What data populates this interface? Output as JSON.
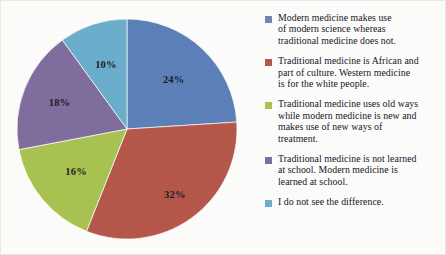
{
  "chart_data": {
    "type": "pie",
    "title": "",
    "labels": [
      "Modern medicine makes use of modern science whereas traditional medicine does not.",
      "Traditional medicine is African and part of culture. Western medicine is for the white people.",
      "Traditional medicine uses old ways while modern medicine is new and makes use of new ways of treatment.",
      "Traditional medicine is not learned at school. Modern medicine is learned at school.",
      "I do not see the difference."
    ],
    "values": [
      24,
      32,
      16,
      18,
      10
    ],
    "value_labels": [
      "24%",
      "32%",
      "16%",
      "18%",
      "10%"
    ],
    "colors": [
      "#5b80b8",
      "#b5574a",
      "#a8c351",
      "#7f6d9e",
      "#6aaecd"
    ],
    "start_angle": 0,
    "direction": "clockwise",
    "legend_position": "right",
    "grid": false
  },
  "legend": {
    "items": [
      {
        "color": "#6a86b8",
        "lines": [
          "Modern medicine makes use",
          "of modern science whereas",
          "traditional medicine does not."
        ]
      },
      {
        "color": "#b5574a",
        "lines": [
          "Traditional medicine is African and",
          "part of culture. Western medicine",
          "is for the white people."
        ]
      },
      {
        "color": "#a8c351",
        "lines": [
          "Traditional medicine uses old ways",
          "while modern medicine is new and",
          "makes use of new ways of",
          "treatment."
        ]
      },
      {
        "color": "#7f6d9e",
        "lines": [
          "Traditional medicine is not learned",
          "at school. Modern medicine is",
          "learned at school."
        ]
      },
      {
        "color": "#6aaecd",
        "lines": [
          "I do not see the difference."
        ]
      }
    ]
  },
  "slice_labels": {
    "blue": "24%",
    "red": "32%",
    "green": "16%",
    "purple": "18%",
    "cyan": "10%"
  }
}
